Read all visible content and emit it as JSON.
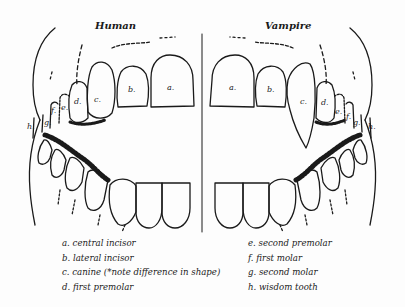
{
  "diagram": {
    "titles": {
      "left": "Human",
      "right": "Vampire"
    },
    "colors": {
      "ink": "#1a1a1a",
      "background": "#fdfdfd"
    },
    "tooth_labels": {
      "human": {
        "a": "a.",
        "b": "b.",
        "c": "c.",
        "d": "d.",
        "e": "e.",
        "f": "f.",
        "g": "g.",
        "h": "h."
      },
      "vampire": {
        "a": "a.",
        "b": "b.",
        "c": "c.",
        "d": "d.",
        "e": "e.",
        "f": "f.",
        "g": "g.",
        "h": "h."
      }
    },
    "legend": {
      "left": [
        "a. central incisor",
        "b. lateral incisor",
        "c. canine (*note difference in shape)",
        "d. first premolar"
      ],
      "right": [
        "e. second premolar",
        "f. first molar",
        "g. second molar",
        "h. wisdom tooth"
      ]
    }
  }
}
